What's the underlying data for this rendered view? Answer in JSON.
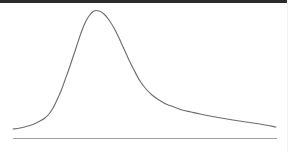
{
  "figure": {
    "title": "",
    "background_color": "#ffffff",
    "width": 288,
    "height": 152
  },
  "decorations": {
    "top_rule_color": "#2b2b2b",
    "right_edge_color": "#f2f2f2"
  },
  "axis": {
    "baseline_color": "#9e9e9e",
    "baseline_y": 138,
    "baseline_x_start": 13,
    "baseline_x_end": 277,
    "tick_labels": [],
    "axis_label": ""
  },
  "chart_data": {
    "type": "line",
    "title": "",
    "subtitle": "",
    "xlabel": "",
    "ylabel": "",
    "xlim": [
      13,
      277
    ],
    "ylim": [
      0,
      1
    ],
    "grid": false,
    "legend": [],
    "legend_position": "none",
    "annotations": [],
    "description": "Right-skewed unimodal density curve with a sharp left flank, a peak near the left third, and a long shallow right tail.",
    "series": [
      {
        "name": "density",
        "color": "#6e6e6e",
        "stroke_width": 1.15,
        "x": [
          13,
          20,
          28,
          34,
          40,
          45,
          49,
          53,
          57,
          61,
          65,
          69,
          73,
          77,
          81,
          85,
          89,
          94,
          99,
          104,
          109,
          114,
          119,
          124,
          129,
          134,
          140,
          146,
          152,
          159,
          166,
          174,
          182,
          191,
          200,
          210,
          221,
          233,
          246,
          260,
          276
        ],
        "y": [
          129,
          128,
          126,
          124,
          121,
          118,
          114,
          108,
          100,
          91,
          80,
          69,
          57,
          45,
          33,
          23,
          16,
          11,
          11,
          14,
          20,
          28,
          38,
          49,
          60,
          70,
          81,
          89,
          95,
          100,
          104,
          107,
          110,
          112,
          114,
          116,
          118,
          120,
          122,
          124,
          127
        ],
        "peak": {
          "x": 96,
          "y": 10,
          "label": ""
        },
        "left_tail_start": {
          "x": 13,
          "y": 129
        },
        "right_tail_end": {
          "x": 276,
          "y": 128
        }
      }
    ],
    "note": "Coordinates are expressed in screenshot pixel space; y increases downward."
  }
}
